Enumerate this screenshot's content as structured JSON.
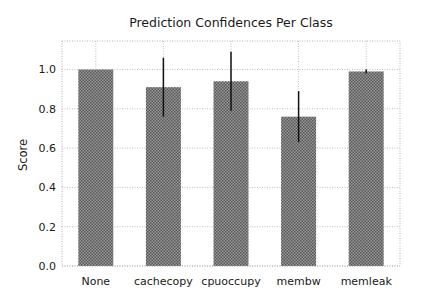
{
  "chart_data": {
    "type": "bar",
    "title": "Prediction Confidences Per Class",
    "xlabel": "",
    "ylabel": "Score",
    "categories": [
      "None",
      "cachecopy",
      "cpuoccupy",
      "membw",
      "memleak"
    ],
    "values": [
      1.0,
      0.91,
      0.94,
      0.76,
      0.99
    ],
    "errors": [
      0.0,
      0.15,
      0.15,
      0.13,
      0.01
    ],
    "ylim": [
      0,
      1.145
    ],
    "yticks": [
      0.0,
      0.2,
      0.4,
      0.6,
      0.8,
      1.0
    ],
    "ytick_labels": [
      "0.0",
      "0.2",
      "0.4",
      "0.6",
      "0.8",
      "1.0"
    ],
    "grid": true,
    "legend": null,
    "bar_color": "#777777",
    "bar_pattern": "crosshatch",
    "error_bar_color": "#111111"
  }
}
